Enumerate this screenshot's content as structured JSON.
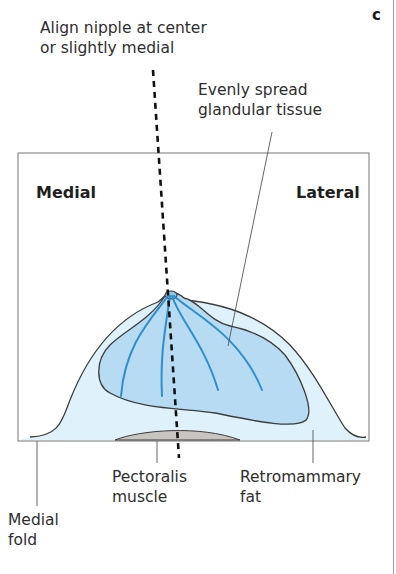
{
  "panel": {
    "letter": "c"
  },
  "annotations": {
    "align_nipple": {
      "line1": "Align nipple at center",
      "line2": "or slightly medial"
    },
    "glandular": {
      "line1": "Evenly spread",
      "line2": "glandular tissue"
    },
    "medial_side": "Medial",
    "lateral_side": "Lateral",
    "pectoralis": {
      "line1": "Pectoralis",
      "line2": "muscle"
    },
    "retromammary": {
      "line1": "Retromammary",
      "line2": "fat"
    },
    "medial_fold": {
      "line1": "Medial",
      "line2": "fold"
    }
  },
  "colors": {
    "outer_tissue": "#dff1fa",
    "gland_fill": "#b7dbf3",
    "duct_lines": "#2f8fcd",
    "muscle_fill": "#c8c5c1",
    "outline": "#3d3d3d",
    "frame": "#777777"
  }
}
